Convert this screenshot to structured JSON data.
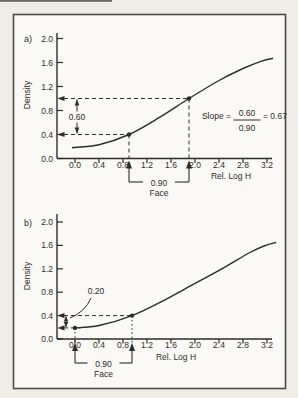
{
  "figure": {
    "bg_page": "#efede7",
    "bg_frame": "#faf9f5",
    "ink": "#2e2c2a",
    "frame_border": "#4b4a47",
    "frame_px": [
      13.5,
      14.5,
      272,
      374
    ],
    "artifact_px": [
      0,
      0,
      112,
      1.8
    ]
  },
  "chart_data": [
    {
      "id": "a",
      "type": "line",
      "panel_label": "a)",
      "xlabel": "Rel. Log H",
      "ylabel": "Density",
      "xlim": [
        0,
        3.2
      ],
      "ylim": [
        0,
        2.0
      ],
      "xticks": [
        "0.0",
        "0.4",
        "0.8",
        "1.2",
        "1.6",
        "2.0",
        "2.4",
        "2.8",
        "3.2"
      ],
      "yticks": [
        "0.0",
        "0.4",
        "0.8",
        "1.2",
        "1.6",
        "2.0"
      ],
      "tick_step": 0.4,
      "grid": false,
      "curve": [
        [
          -0.05,
          0.18
        ],
        [
          0.4,
          0.23
        ],
        [
          0.9,
          0.4
        ],
        [
          1.4,
          0.68
        ],
        [
          1.9,
          1.0
        ],
        [
          2.4,
          1.3
        ],
        [
          2.8,
          1.5
        ],
        [
          3.1,
          1.62
        ],
        [
          3.3,
          1.67
        ]
      ],
      "marked_points": [
        [
          0.9,
          0.4
        ],
        [
          1.9,
          1.0
        ]
      ],
      "guides": [
        {
          "t": "hdash",
          "y": 1.0,
          "x2": 1.9,
          "arrow": "left"
        },
        {
          "t": "hdash",
          "y": 0.4,
          "x2": 0.9,
          "arrow": "left"
        },
        {
          "t": "vdash",
          "x": 0.9,
          "y1": 0.4,
          "y2px": 158
        },
        {
          "t": "vdash",
          "x": 1.9,
          "y1": 1.0,
          "y2px": 158
        },
        {
          "t": "dot",
          "x": 0.9,
          "y": 0.4
        },
        {
          "t": "dot",
          "x": 1.9,
          "y": 1.0
        },
        {
          "t": "vdarrow",
          "xpx": 77,
          "y1px": 99.5,
          "y2px": 133.5
        },
        {
          "t": "label",
          "text": "0.60",
          "px": [
            77,
            117
          ],
          "bg": true
        },
        {
          "t": "bracket",
          "x1px": 129,
          "x2px": 189,
          "tip_y": 160.5,
          "bar_y": 182,
          "label": "0.90",
          "sub": "Face"
        },
        {
          "t": "fraction",
          "lhs": "Slope =",
          "num": "0.60",
          "den": "0.90",
          "rhs": "= 0.67",
          "px": [
            247,
            120
          ]
        }
      ],
      "layout": {
        "origin": [
          75,
          158.5
        ],
        "scale": [
          60,
          60
        ],
        "axis_x": 57,
        "axis_top": 33,
        "axis_right": 272,
        "xtick_label_y": 168,
        "xlabel_px": [
          231,
          178.5
        ],
        "ylabel_px": [
          30,
          95
        ],
        "panel_px": [
          28,
          41.5
        ]
      }
    },
    {
      "id": "b",
      "type": "line",
      "panel_label": "b)",
      "xlabel": "Rel. Log H",
      "ylabel": "Density",
      "xlim": [
        0,
        3.2
      ],
      "ylim": [
        0,
        2.0
      ],
      "xticks": [
        "0.0",
        "0.4",
        "0.8",
        "1.2",
        "1.6",
        "2.0",
        "2.4",
        "2.8",
        "3.2"
      ],
      "yticks": [
        "0.0",
        "0.4",
        "0.8",
        "1.2",
        "1.6",
        "2.0"
      ],
      "tick_step": 0.4,
      "grid": false,
      "curve": [
        [
          0,
          0.19
        ],
        [
          0.4,
          0.23
        ],
        [
          0.95,
          0.4
        ],
        [
          1.5,
          0.67
        ],
        [
          2.0,
          0.95
        ],
        [
          2.5,
          1.23
        ],
        [
          2.9,
          1.47
        ],
        [
          3.15,
          1.59
        ],
        [
          3.35,
          1.65
        ]
      ],
      "marked_points": [
        [
          0.0,
          0.19
        ],
        [
          0.95,
          0.4
        ]
      ],
      "guides": [
        {
          "t": "hdash",
          "y": 0.4,
          "x2": 0.95,
          "arrow": "left"
        },
        {
          "t": "hdash",
          "y": 0.19,
          "x2": 0.1,
          "arrow": "left"
        },
        {
          "t": "vdash",
          "x": 0.95,
          "y1": 0.4,
          "y2px": 351,
          "dotted": true
        },
        {
          "t": "vdash",
          "x": 0.0,
          "y1": 0.19,
          "y2px": 351,
          "dotted": true
        },
        {
          "t": "dot",
          "x": 0.0,
          "y": 0.19
        },
        {
          "t": "dot",
          "x": 0.95,
          "y": 0.4
        },
        {
          "t": "vdarrow",
          "xpx": 66,
          "y1px": 316.5,
          "y2px": 327
        },
        {
          "t": "label",
          "text": "0.20",
          "px": [
            96,
            291
          ]
        },
        {
          "t": "leader",
          "pts": [
            [
              91,
              298
            ],
            [
              85,
              312
            ],
            [
              70,
              318
            ]
          ]
        },
        {
          "t": "bracket",
          "x1px": 75,
          "x2px": 132,
          "tip_y": 343,
          "bar_y": 363,
          "label": "0.90",
          "sub": "Face"
        }
      ],
      "layout": {
        "origin": [
          75,
          339
        ],
        "scale": [
          60,
          58.5
        ],
        "axis_x": 57,
        "axis_top": 214,
        "axis_right": 272,
        "xtick_label_y": 348,
        "xlabel_px": [
          176,
          360
        ],
        "ylabel_px": [
          30,
          276
        ],
        "panel_px": [
          28,
          226
        ]
      }
    }
  ]
}
